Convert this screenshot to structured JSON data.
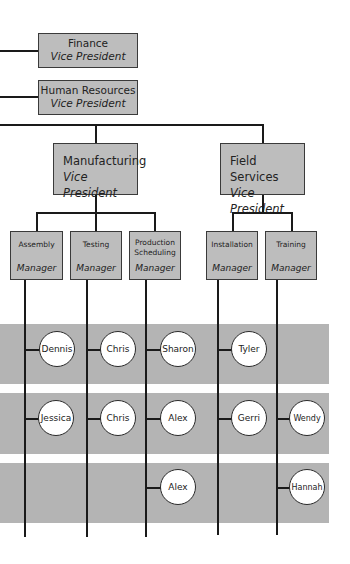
{
  "vice_presidents": [
    {
      "department": "Finance",
      "title": "Vice President"
    },
    {
      "department": "Human Resources",
      "title": "Vice President"
    },
    {
      "department": "Manufacturing",
      "title": "Vice President"
    },
    {
      "department": "Field Services",
      "title": "Vice President"
    }
  ],
  "managers": [
    {
      "department": "Assembly",
      "title": "Manager"
    },
    {
      "department": "Testing",
      "title": "Manager"
    },
    {
      "department": "Production Scheduling",
      "title": "Manager"
    },
    {
      "department": "Installation",
      "title": "Manager"
    },
    {
      "department": "Training",
      "title": "Manager"
    }
  ],
  "employees": {
    "row1": [
      "Dennis",
      "Chris",
      "Sharon",
      "Tyler"
    ],
    "row2": [
      "Jessica",
      "Chris",
      "Alex",
      "Gerri",
      "Wendy"
    ],
    "row3": [
      "Alex",
      "Hannah"
    ]
  },
  "colors": {
    "band": "#b4b4b4",
    "box": "#bdbdbd",
    "line": "#1a1a1a"
  }
}
